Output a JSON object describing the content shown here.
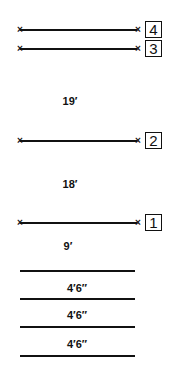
{
  "diagram": {
    "wires": [
      {
        "id": "4",
        "label": "4",
        "y": 30
      },
      {
        "id": "3",
        "label": "3",
        "y": 48
      },
      {
        "id": "2",
        "label": "2",
        "y": 141
      },
      {
        "id": "1",
        "label": "1",
        "y": 223
      }
    ],
    "spacings": [
      {
        "text": "19′",
        "y": 100
      },
      {
        "text": "18′",
        "y": 183
      },
      {
        "text": "9′",
        "y": 245
      }
    ],
    "ground_segments": [
      {
        "text": "4′6″"
      },
      {
        "text": "4′6″"
      },
      {
        "text": "4′6″"
      }
    ]
  }
}
